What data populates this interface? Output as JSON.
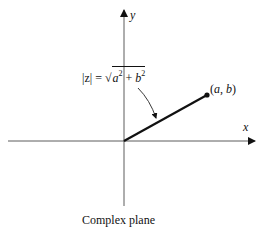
{
  "diagram": {
    "title": "Complex plane",
    "axes": {
      "x_label": "x",
      "y_label": "y"
    },
    "point": {
      "label": "(a, b)"
    },
    "formula": {
      "lhs": "|z|",
      "equals": "=",
      "radical_sign": "√",
      "radicand_a": "a",
      "radicand_plus": "+",
      "radicand_b": "b",
      "exponent": "2"
    },
    "caption": "Complex plane",
    "colors": {
      "ink": "#111111",
      "background": "#ffffff"
    }
  }
}
